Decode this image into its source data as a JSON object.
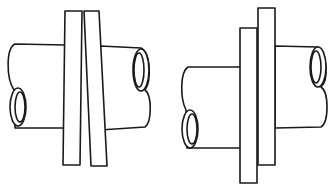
{
  "diagram": {
    "figures": [
      {
        "id": "left",
        "description": "Two pipe ends joined with tapered (wedge) plates between them",
        "plates": 2,
        "plate_shape": "tapered"
      },
      {
        "id": "right",
        "description": "Two offset pipe ends joined with two offset parallel plates",
        "plates": 2,
        "plate_shape": "rectangular-offset"
      }
    ],
    "colors": {
      "stroke": "#1a1a1a",
      "background": "#ffffff"
    }
  }
}
